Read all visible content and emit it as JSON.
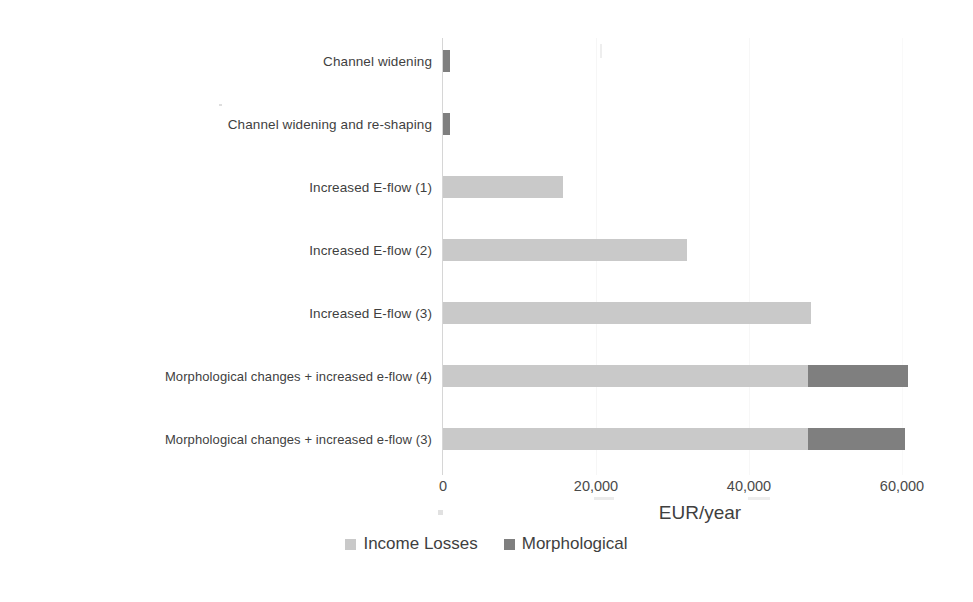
{
  "chart_data": {
    "type": "bar",
    "orientation": "horizontal",
    "stacked": true,
    "title": "",
    "subtitle": "",
    "xlabel": "EUR/year",
    "ylabel": "",
    "xlim": [
      0,
      60000
    ],
    "xticks": [
      0,
      20000,
      40000,
      60000
    ],
    "xtick_labels": [
      "0",
      "20,000",
      "40,000",
      "60,000"
    ],
    "grid": false,
    "legend_position": "bottom",
    "categories": [
      "Channel widening",
      "Channel widening and re-shaping",
      "Increased E-flow (1)",
      "Increased E-flow (2)",
      "Increased E-flow (3)",
      "Morphological changes  + increased e-flow (4)",
      "Morphological changes + increased e-flow (3)"
    ],
    "series": [
      {
        "name": "Income Losses",
        "color": "#c9c9c9",
        "values": [
          0,
          0,
          15700,
          31800,
          48000,
          47600,
          47600
        ]
      },
      {
        "name": "Morphological",
        "color": "#7f7f7f",
        "values": [
          900,
          900,
          0,
          0,
          0,
          13000,
          12600
        ]
      }
    ],
    "totals": [
      900,
      900,
      15700,
      31800,
      48000,
      60600,
      60200
    ]
  },
  "legend": {
    "items": [
      {
        "label": "Income Losses",
        "color": "#c9c9c9"
      },
      {
        "label": "Morphological",
        "color": "#7f7f7f"
      }
    ]
  },
  "axis": {
    "x_title": "EUR/year",
    "ticks": [
      "0",
      "20,000",
      "40,000",
      "60,000"
    ]
  }
}
